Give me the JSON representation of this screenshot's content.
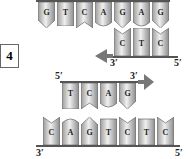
{
  "step_label": "4",
  "template_top": {
    "bases": [
      "G",
      "T",
      "C",
      "A",
      "G",
      "A",
      "G"
    ]
  },
  "primer_top": {
    "bases": [
      "C",
      "T",
      "C"
    ],
    "label_left": "3′",
    "label_right": "5′",
    "direction": "left"
  },
  "new_strand": {
    "bases": [
      "T",
      "C",
      "A",
      "G"
    ],
    "label_left": "5′",
    "label_right": "3′",
    "direction": "right"
  },
  "template_bottom": {
    "bases": [
      "C",
      "A",
      "G",
      "T",
      "C",
      "T",
      "C"
    ],
    "label_left": "3′",
    "label_right": "5′"
  },
  "colors": {
    "base_fill_light": "#e8e8e8",
    "base_fill_dark": "#8a8a8a",
    "backbone": "#555555",
    "arrow": "#777777"
  }
}
